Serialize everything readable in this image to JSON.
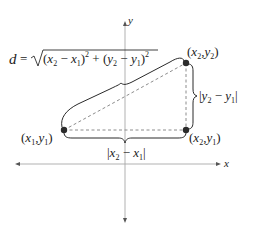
{
  "diagram": {
    "axes": {
      "x_label": "x",
      "y_label": "y"
    },
    "points": [
      {
        "id": "p1",
        "label_open": "(",
        "var1": "x",
        "sub1": "1",
        "comma": ",",
        "var2": "y",
        "sub2": "1",
        "label_close": ")"
      },
      {
        "id": "p2",
        "label_open": "(",
        "var1": "x",
        "sub1": "2",
        "comma": ",",
        "var2": "y",
        "sub2": "2",
        "label_close": ")"
      },
      {
        "id": "p3",
        "label_open": "(",
        "var1": "x",
        "sub1": "2",
        "comma": ",",
        "var2": "y",
        "sub2": "1",
        "label_close": ")"
      }
    ],
    "formula": {
      "lhs": "d",
      "equals": "=",
      "open1": "(",
      "a_var": "x",
      "a_sub": "2",
      "minus1": " − ",
      "b_var": "x",
      "b_sub": "1",
      "close1": ")",
      "exp1": "2",
      "plus": " + ",
      "open2": "(",
      "c_var": "y",
      "c_sub": "2",
      "minus2": " − ",
      "d_var": "y",
      "d_sub": "1",
      "close2": ")",
      "exp2": "2"
    },
    "horizontal_length": {
      "bar_left": "|",
      "var1": "x",
      "sub1": "2",
      "minus": " − ",
      "var2": "x",
      "sub2": "1",
      "bar_right": "|"
    },
    "vertical_length": {
      "bar_left": "|",
      "var1": "y",
      "sub1": "2",
      "minus": " − ",
      "var2": "y",
      "sub2": "1",
      "bar_right": "|"
    },
    "colors": {
      "point": "#2b2b2b",
      "axis": "#a8a8a8",
      "dashed": "#8c8c8c",
      "text": "#222222"
    }
  }
}
